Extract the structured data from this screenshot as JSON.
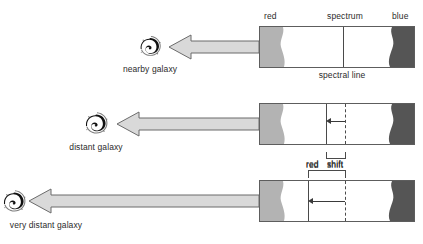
{
  "diagram": {
    "title_alt": "Red shift of spectral lines from receding galaxies",
    "colors": {
      "red_band": "#b3b3b3",
      "blue_band": "#555555",
      "bar_border": "#5d5d5d",
      "line": "#4a4a4a",
      "arrow_fill": "#d9d9d9",
      "arrow_stroke": "#6b6b6b",
      "text": "#2b2b2b",
      "galaxy": "#111111"
    },
    "top_labels": {
      "red": "red",
      "spectrum": "spectrum",
      "blue": "blue"
    },
    "caption_row1": "spectral line",
    "shift_label_red": "red",
    "shift_label_shift": "shift",
    "rows": [
      {
        "galaxy_label": "nearby galaxy",
        "galaxy_size": "small",
        "shift_amount": 0,
        "has_shift_bracket": false,
        "has_measure_arrow": false
      },
      {
        "galaxy_label": "distant galaxy",
        "galaxy_size": "medium",
        "shift_amount": 19,
        "has_shift_bracket": true,
        "has_measure_arrow": true
      },
      {
        "galaxy_label": "very distant galaxy",
        "galaxy_size": "medium",
        "shift_amount": 37,
        "has_shift_bracket": true,
        "has_measure_arrow": true
      }
    ]
  }
}
